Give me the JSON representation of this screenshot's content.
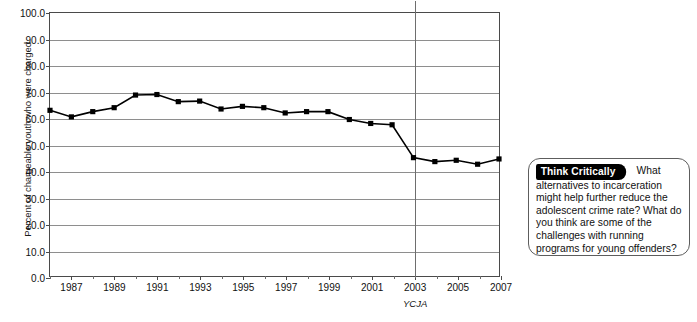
{
  "chart_data": {
    "type": "line",
    "title": "",
    "xlabel": "",
    "ylabel": "Percent of chargeable youth who were charged",
    "ylim": [
      0.0,
      100.0
    ],
    "ytick_step": 10.0,
    "ytick_labels": [
      "100.0",
      "90.0",
      "80.0",
      "70.0",
      "60.0",
      "50.0",
      "40.0",
      "30.0",
      "20.0",
      "10.0",
      "0.0"
    ],
    "xlim": [
      1986,
      2007
    ],
    "xtick_labels": [
      "1987",
      "1989",
      "1991",
      "1993",
      "1995",
      "1997",
      "1999",
      "2001",
      "2003",
      "2005",
      "2007"
    ],
    "grid": "horizontal",
    "legend": "none",
    "marker": "square",
    "line_color": "#000000",
    "grid_color": "#8e8e8e",
    "x": [
      1986,
      1987,
      1988,
      1989,
      1990,
      1991,
      1992,
      1993,
      1994,
      1995,
      1996,
      1997,
      1998,
      1999,
      2000,
      2001,
      2002,
      2003,
      2004,
      2005,
      2006,
      2007
    ],
    "values": [
      63.0,
      60.5,
      62.5,
      64.0,
      68.8,
      69.0,
      66.3,
      66.5,
      63.5,
      64.5,
      64.0,
      62.0,
      62.5,
      62.5,
      59.5,
      58.0,
      57.5,
      45.0,
      43.5,
      44.0,
      42.5,
      44.5
    ],
    "annotations": [
      {
        "name": "ycja-marker",
        "label": "YCJA",
        "x": 2003,
        "type": "vertical-line"
      }
    ]
  },
  "callout": {
    "tab_label": "Think Critically",
    "text": "What alternatives to incarceration might help further reduce the adolescent crime rate? What do you think are some of the challenges with running programs for young offenders?"
  }
}
